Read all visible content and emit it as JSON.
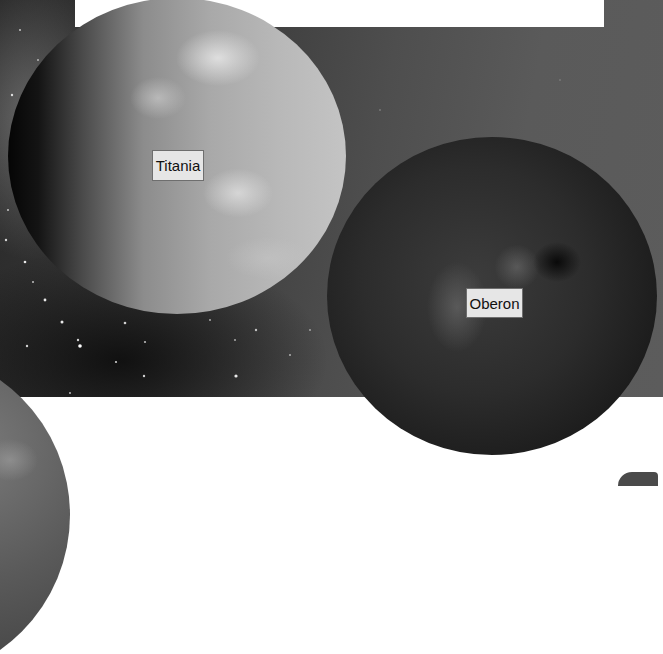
{
  "scene": {
    "background": {
      "space_color": "#5a5a5a",
      "dark_color": "#2a2a2a",
      "page_color": "#ffffff"
    },
    "moons": [
      {
        "id": "titania",
        "label": "Titania",
        "tone": "light-gray"
      },
      {
        "id": "oberon",
        "label": "Oberon",
        "tone": "dark-gray"
      }
    ]
  },
  "labels": {
    "titania": "Titania",
    "oberon": "Oberon"
  }
}
